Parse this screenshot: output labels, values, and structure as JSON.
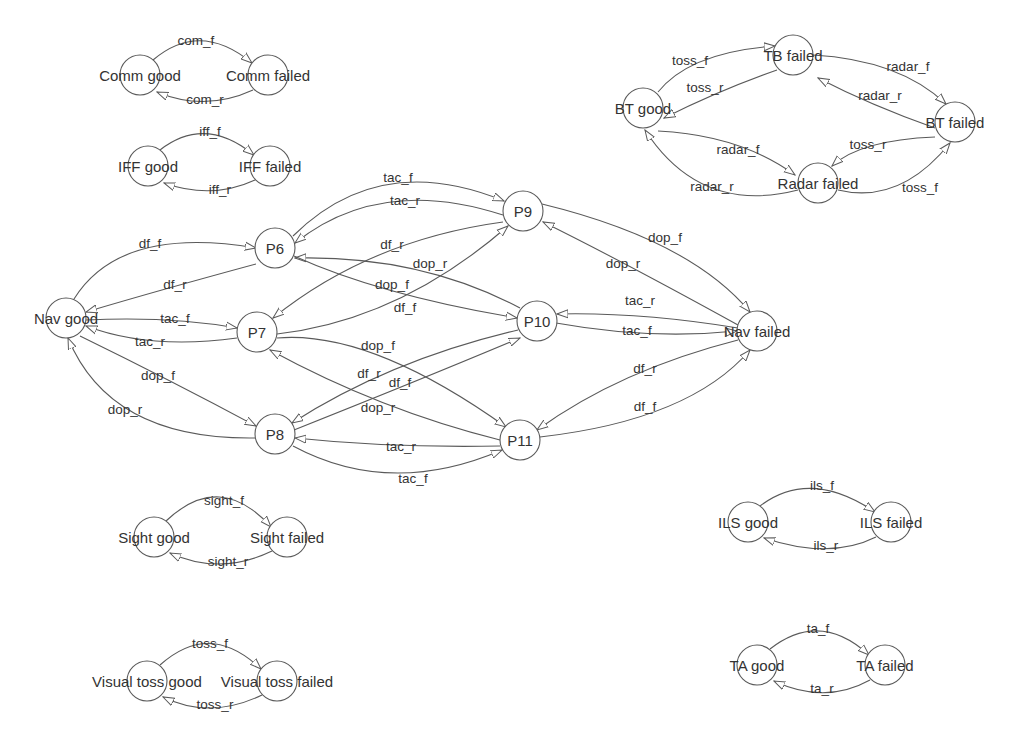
{
  "diagram": {
    "type": "state-transition-graph",
    "nodes": [
      {
        "id": "comm_good",
        "label": "Comm good",
        "x": 140,
        "y": 75
      },
      {
        "id": "comm_failed",
        "label": "Comm failed",
        "x": 268,
        "y": 75
      },
      {
        "id": "iff_good",
        "label": "IFF good",
        "x": 148,
        "y": 166
      },
      {
        "id": "iff_failed",
        "label": "IFF failed",
        "x": 270,
        "y": 166
      },
      {
        "id": "bt_good",
        "label": "BT good",
        "x": 643,
        "y": 108
      },
      {
        "id": "tb_failed",
        "label": "TB failed",
        "x": 793,
        "y": 55
      },
      {
        "id": "bt_failed",
        "label": "BT failed",
        "x": 955,
        "y": 122
      },
      {
        "id": "radar_failed",
        "label": "Radar failed",
        "x": 818,
        "y": 183
      },
      {
        "id": "nav_good",
        "label": "Nav good",
        "x": 66,
        "y": 318
      },
      {
        "id": "p6",
        "label": "P6",
        "x": 275,
        "y": 248
      },
      {
        "id": "p7",
        "label": "P7",
        "x": 257,
        "y": 332
      },
      {
        "id": "p8",
        "label": "P8",
        "x": 275,
        "y": 434
      },
      {
        "id": "p9",
        "label": "P9",
        "x": 523,
        "y": 211
      },
      {
        "id": "p10",
        "label": "P10",
        "x": 537,
        "y": 321
      },
      {
        "id": "p11",
        "label": "P11",
        "x": 520,
        "y": 440
      },
      {
        "id": "nav_failed",
        "label": "Nav failed",
        "x": 757,
        "y": 331
      },
      {
        "id": "sight_good",
        "label": "Sight good",
        "x": 154,
        "y": 537
      },
      {
        "id": "sight_failed",
        "label": "Sight failed",
        "x": 287,
        "y": 537
      },
      {
        "id": "vt_good",
        "label": "Visual toss good",
        "x": 147,
        "y": 681
      },
      {
        "id": "vt_failed",
        "label": "Visual toss failed",
        "x": 277,
        "y": 681
      },
      {
        "id": "ils_good",
        "label": "ILS good",
        "x": 748,
        "y": 522
      },
      {
        "id": "ils_failed",
        "label": "ILS failed",
        "x": 891,
        "y": 522
      },
      {
        "id": "ta_good",
        "label": "TA good",
        "x": 757,
        "y": 665
      },
      {
        "id": "ta_failed",
        "label": "TA failed",
        "x": 885,
        "y": 665
      }
    ],
    "edges": [
      {
        "from": "comm_good",
        "to": "comm_failed",
        "label": "com_f",
        "path": "M153,60 Q200,20 252,63",
        "lx": 196,
        "ly": 40
      },
      {
        "from": "comm_failed",
        "to": "comm_good",
        "label": "com_r",
        "path": "M253,90 Q205,112 157,92",
        "lx": 205,
        "ly": 99
      },
      {
        "from": "iff_good",
        "to": "iff_failed",
        "label": "iff_f",
        "path": "M160,150 Q205,115 254,155",
        "lx": 210,
        "ly": 131
      },
      {
        "from": "iff_failed",
        "to": "iff_good",
        "label": "iff_r",
        "path": "M255,180 Q212,200 164,183",
        "lx": 220,
        "ly": 189
      },
      {
        "from": "bt_good",
        "to": "tb_failed",
        "label": "toss_f",
        "path": "M658,92 Q690,52 775,46",
        "lx": 690,
        "ly": 60
      },
      {
        "from": "tb_failed",
        "to": "bt_good",
        "label": "toss_r",
        "path": "M777,70 Q720,90 664,118",
        "lx": 705,
        "ly": 87
      },
      {
        "from": "tb_failed",
        "to": "bt_failed",
        "label": "radar_f",
        "path": "M813,55 Q900,60 946,104",
        "lx": 908,
        "ly": 66
      },
      {
        "from": "bt_failed",
        "to": "tb_failed",
        "label": "radar_r",
        "path": "M935,128 Q870,105 818,78",
        "lx": 880,
        "ly": 95
      },
      {
        "from": "bt_failed",
        "to": "radar_failed",
        "label": "toss_r",
        "path": "M935,137 Q860,140 832,166",
        "lx": 868,
        "ly": 144
      },
      {
        "from": "radar_failed",
        "to": "bt_failed",
        "label": "toss_f",
        "path": "M838,190 Q900,205 950,143",
        "lx": 920,
        "ly": 187
      },
      {
        "from": "bt_good",
        "to": "radar_failed",
        "label": "radar_f",
        "path": "M658,131 Q740,135 795,175",
        "lx": 738,
        "ly": 149
      },
      {
        "from": "radar_failed",
        "to": "bt_good",
        "label": "radar_r",
        "path": "M798,190 Q700,215 645,130",
        "lx": 712,
        "ly": 186
      },
      {
        "from": "nav_good",
        "to": "p6",
        "label": "df_f",
        "path": "M74,299 Q120,225 256,248",
        "lx": 150,
        "ly": 243
      },
      {
        "from": "p6",
        "to": "nav_good",
        "label": "df_r",
        "path": "M256,264 Q160,290 86,312",
        "lx": 175,
        "ly": 284
      },
      {
        "from": "nav_good",
        "to": "p7",
        "label": "tac_f",
        "path": "M86,320 Q170,316 237,328",
        "lx": 175,
        "ly": 318
      },
      {
        "from": "p7",
        "to": "nav_good",
        "label": "tac_r",
        "path": "M237,338 Q150,350 86,326",
        "lx": 150,
        "ly": 341
      },
      {
        "from": "nav_good",
        "to": "p8",
        "label": "dop_f",
        "path": "M80,336 Q170,380 256,426",
        "lx": 158,
        "ly": 375
      },
      {
        "from": "p8",
        "to": "nav_good",
        "label": "dop_r",
        "path": "M255,438 Q110,440 68,338",
        "lx": 125,
        "ly": 409
      },
      {
        "from": "p6",
        "to": "p9",
        "label": "tac_f",
        "path": "M293,236 Q380,150 504,201",
        "lx": 398,
        "ly": 177
      },
      {
        "from": "p9",
        "to": "p6",
        "label": "tac_r",
        "path": "M503,215 Q380,175 295,243",
        "lx": 405,
        "ly": 200
      },
      {
        "from": "p9",
        "to": "p7",
        "label": "df_r",
        "path": "M503,222 Q370,240 273,318",
        "lx": 392,
        "ly": 244
      },
      {
        "from": "p7",
        "to": "p9",
        "label": "df_f",
        "path": "M277,334 Q400,320 508,226",
        "lx": 405,
        "ly": 307
      },
      {
        "from": "p10",
        "to": "p6",
        "label": "dop_r",
        "path": "M520,308 Q420,255 295,258",
        "lx": 430,
        "ly": 263
      },
      {
        "from": "p6",
        "to": "p10",
        "label": "dop_f",
        "path": "M294,256 Q380,295 517,318",
        "lx": 392,
        "ly": 284
      },
      {
        "from": "p7",
        "to": "p11",
        "label": "dop_f",
        "path": "M277,338 Q370,330 506,427",
        "lx": 378,
        "ly": 345
      },
      {
        "from": "p11",
        "to": "p7",
        "label": "dop_r",
        "path": "M500,440 Q380,410 270,350",
        "lx": 378,
        "ly": 407
      },
      {
        "from": "p10",
        "to": "p8",
        "label": "df_r",
        "path": "M518,330 Q390,360 292,423",
        "lx": 369,
        "ly": 373
      },
      {
        "from": "p8",
        "to": "p10",
        "label": "df_f",
        "path": "M294,430 Q420,380 520,338",
        "lx": 400,
        "ly": 382
      },
      {
        "from": "p11",
        "to": "p8",
        "label": "tac_r",
        "path": "M500,446 Q390,448 295,438",
        "lx": 401,
        "ly": 446
      },
      {
        "from": "p8",
        "to": "p11",
        "label": "tac_f",
        "path": "M293,446 Q390,498 502,450",
        "lx": 413,
        "ly": 478
      },
      {
        "from": "p9",
        "to": "nav_failed",
        "label": "dop_f",
        "path": "M542,204 Q690,240 750,312",
        "lx": 665,
        "ly": 237
      },
      {
        "from": "nav_failed",
        "to": "p9",
        "label": "dop_r",
        "path": "M738,325 Q620,260 543,222",
        "lx": 623,
        "ly": 263
      },
      {
        "from": "nav_failed",
        "to": "p10",
        "label": "tac_r",
        "path": "M738,328 Q640,312 557,314",
        "lx": 640,
        "ly": 300
      },
      {
        "from": "p10",
        "to": "nav_failed",
        "label": "tac_f",
        "path": "M556,323 Q650,340 737,331",
        "lx": 637,
        "ly": 330
      },
      {
        "from": "nav_failed",
        "to": "p11",
        "label": "df_r",
        "path": "M738,340 Q620,370 537,430",
        "lx": 645,
        "ly": 368
      },
      {
        "from": "p11",
        "to": "nav_failed",
        "label": "df_f",
        "path": "M540,437 Q690,420 750,350",
        "lx": 645,
        "ly": 406
      },
      {
        "from": "sight_good",
        "to": "sight_failed",
        "label": "sight_f",
        "path": "M166,521 Q220,470 271,527",
        "lx": 224,
        "ly": 500
      },
      {
        "from": "sight_failed",
        "to": "sight_good",
        "label": "sight_r",
        "path": "M272,551 Q220,576 170,553",
        "lx": 228,
        "ly": 561
      },
      {
        "from": "vt_good",
        "to": "vt_failed",
        "label": "toss_f",
        "path": "M160,665 Q210,620 261,669",
        "lx": 210,
        "ly": 643
      },
      {
        "from": "vt_failed",
        "to": "vt_good",
        "label": "toss_r",
        "path": "M262,695 Q210,720 163,697",
        "lx": 215,
        "ly": 704
      },
      {
        "from": "ils_good",
        "to": "ils_failed",
        "label": "ils_f",
        "path": "M760,506 Q810,468 875,512",
        "lx": 822,
        "ly": 485
      },
      {
        "from": "ils_failed",
        "to": "ils_good",
        "label": "ils_r",
        "path": "M876,537 Q830,560 764,538",
        "lx": 826,
        "ly": 545
      },
      {
        "from": "ta_good",
        "to": "ta_failed",
        "label": "ta_f",
        "path": "M770,649 Q820,610 869,655",
        "lx": 818,
        "ly": 628
      },
      {
        "from": "ta_failed",
        "to": "ta_good",
        "label": "ta_r",
        "path": "M870,680 Q825,705 774,681",
        "lx": 822,
        "ly": 688
      }
    ]
  }
}
